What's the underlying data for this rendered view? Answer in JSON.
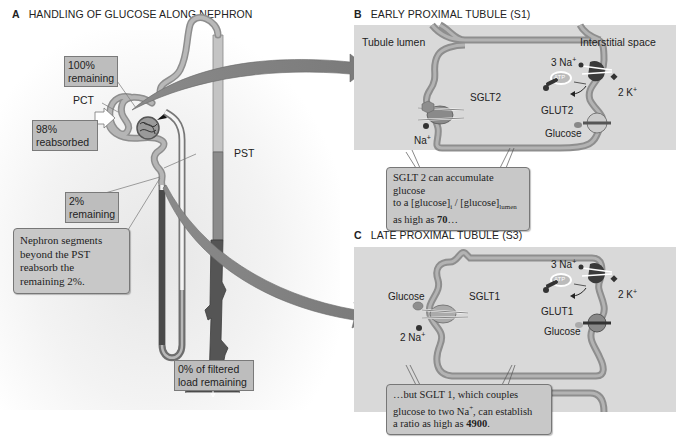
{
  "panel_a": {
    "letter": "A",
    "title": "HANDLING OF GLUCOSE ALONG NEPHRON",
    "labels": {
      "pct": "PCT",
      "pst": "PST"
    },
    "boxes": {
      "remaining_100_line1": "100%",
      "remaining_100_line2": "remaining",
      "reabsorbed_98_line1": "98%",
      "reabsorbed_98_line2": "reabsorbed",
      "remaining_2_line1": "2%",
      "remaining_2_line2": "remaining",
      "beyond_pst_line1": "Nephron segments",
      "beyond_pst_line2": "beyond the PST",
      "beyond_pst_line3": "reabsorb the",
      "beyond_pst_line4": "remaining 2%.",
      "zero_line1": "0% of filtered",
      "zero_line2": "load remaining"
    }
  },
  "panel_b": {
    "letter": "B",
    "title": "EARLY PROXIMAL TUBULE (S1)",
    "tubule_lumen": "Tubule lumen",
    "interstitial_space": "Interstitial space",
    "sglt": "SGLT2",
    "na": "Na",
    "na_sup": "+",
    "pump_na": "3 Na",
    "pump_na_sup": "+",
    "pump_k": "2 K",
    "pump_k_sup": "+",
    "atp": "ATP",
    "glut": "GLUT2",
    "glucose": "Glucose",
    "callout": {
      "line1": "SGLT 2 can accumulate glucose",
      "line2_pre": "to a [glucose]",
      "line2_sub_i": "i",
      "line2_mid": " / [glucose]",
      "line2_sub_lumen": "lumen",
      "line3_pre": "as high as ",
      "line3_bold": "70",
      "line3_post": "…"
    }
  },
  "panel_c": {
    "letter": "C",
    "title": "LATE PROXIMAL TUBULE (S3)",
    "glucose_lumen": "Glucose",
    "sglt": "SGLT1",
    "na": "2 Na",
    "na_sup": "+",
    "pump_na": "3 Na",
    "pump_na_sup": "+",
    "pump_k": "2 K",
    "pump_k_sup": "+",
    "atp": "ATP",
    "glut": "GLUT1",
    "glucose": "Glucose",
    "callout": {
      "line1": "…but SGLT 1, which couples",
      "line2_pre": "glucose to two Na",
      "line2_sup": "+",
      "line2_post": ", can establish",
      "line3_pre": "a ratio as high as ",
      "line3_bold": "4900",
      "line3_post": "."
    }
  }
}
